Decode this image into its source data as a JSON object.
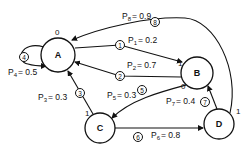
{
  "diagram": {
    "type": "state-transition-graph",
    "nodes": [
      {
        "id": "A",
        "label": "A"
      },
      {
        "id": "B",
        "label": "B"
      },
      {
        "id": "C",
        "label": "C"
      },
      {
        "id": "D",
        "label": "D"
      }
    ],
    "edges": [
      {
        "num": "1",
        "from": "A",
        "to": "B",
        "p_label": "P1 = 0.2",
        "p_sym": "P",
        "p_sub": "1",
        "p_val": "= 0.2"
      },
      {
        "num": "2",
        "from": "B",
        "to": "A",
        "p_label": "P2 = 0.7",
        "p_sym": "P",
        "p_sub": "2",
        "p_val": "= 0.7"
      },
      {
        "num": "3",
        "from": "C",
        "to": "A",
        "p_label": "P3 = 0.3",
        "p_sym": "P",
        "p_sub": "3",
        "p_val": "= 0.3"
      },
      {
        "num": "4",
        "from": "A",
        "to": "A",
        "p_label": "P4 = 0.5",
        "p_sym": "P",
        "p_sub": "4",
        "p_val": "= 0.5"
      },
      {
        "num": "5",
        "from": "B",
        "to": "C",
        "p_label": "P5 = 0.3",
        "p_sym": "P",
        "p_sub": "5",
        "p_val": "= 0.3"
      },
      {
        "num": "6",
        "from": "C",
        "to": "D",
        "p_label": "P6 = 0.8",
        "p_sym": "P",
        "p_sub": "6",
        "p_val": "= 0.8"
      },
      {
        "num": "7",
        "from": "D",
        "to": "B",
        "p_label": "P7 = 0.4",
        "p_sym": "P",
        "p_sub": "7",
        "p_val": "= 0.4"
      },
      {
        "num": "8",
        "from": "D",
        "to": "A",
        "p_label": "P8 = 0.9",
        "p_sym": "P",
        "p_sub": "8",
        "p_val": "= 0.9"
      }
    ],
    "port_labels": {
      "a_in_top": "0",
      "b_in_left": "1",
      "b_out_bottom": "0",
      "c_in_top": "1",
      "d_out_right": "1"
    }
  }
}
